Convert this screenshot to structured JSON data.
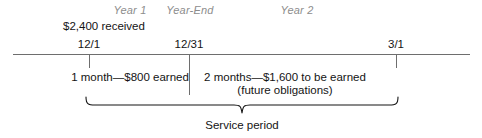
{
  "figure": {
    "type": "accounting-timeline",
    "caption": "Service period"
  },
  "periods": [
    {
      "label": "Year 1",
      "center_x": 130
    },
    {
      "label": "Year-End",
      "center_x": 190
    },
    {
      "label": "Year 2",
      "center_x": 297
    }
  ],
  "callout": {
    "received": "$2,400 received"
  },
  "dates": [
    {
      "label": "12/1",
      "x": 89
    },
    {
      "label": "12/31",
      "x": 189
    },
    {
      "label": "3/1",
      "x": 396
    }
  ],
  "segments": [
    {
      "line1": "1 month—$800 earned",
      "line2": "",
      "center_x": 130
    },
    {
      "line1": "2 months—$1,600 to be earned",
      "line2": "(future obligations)",
      "center_x": 285
    }
  ],
  "brace": {
    "caption": "Service period",
    "start_x": 86,
    "end_x": 400,
    "point_x": 242
  },
  "colors": {
    "axis": "#6e6e6e",
    "period_label": "#8d8d8d",
    "text": "#141414",
    "background": "#ffffff"
  }
}
